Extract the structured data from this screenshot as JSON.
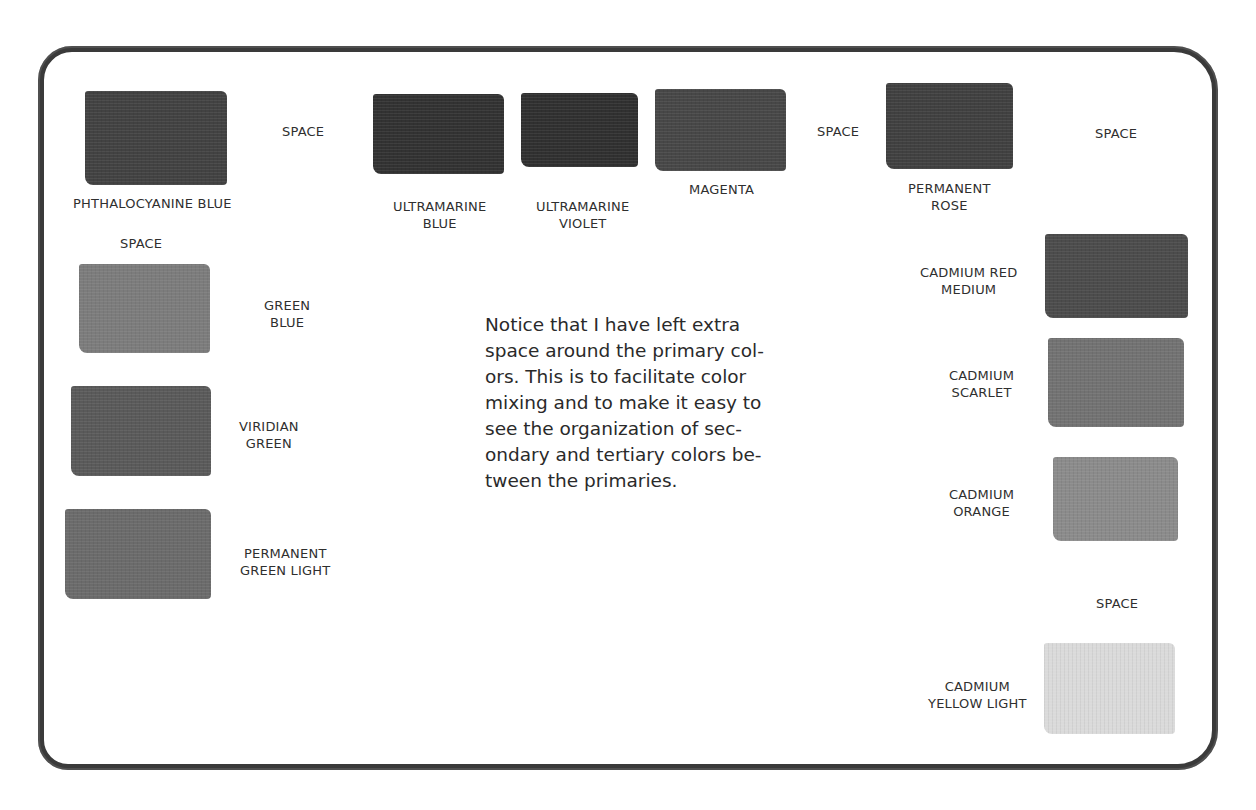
{
  "note": "Notice that I have left extra\nspace around the primary col-\nors. This is to facilitate color\nmixing and to make it easy to\nsee the organization of sec-\nondary and tertiary colors be-\ntween the primaries.",
  "space_label": "SPACE",
  "swatches": [
    {
      "name": "PHTHALOCYANINE BLUE",
      "line1": "PHTHALOCYANINE  BLUE",
      "line2": "",
      "color": "#454545"
    },
    {
      "name": "ULTRAMARINE BLUE",
      "line1": "ULTRAMARINE",
      "line2": "BLUE",
      "color": "#363636"
    },
    {
      "name": "ULTRAMARINE VIOLET",
      "line1": "ULTRAMARINE",
      "line2": "VIOLET",
      "color": "#343434"
    },
    {
      "name": "MAGENTA",
      "line1": "MAGENTA",
      "line2": "",
      "color": "#4a4a4a"
    },
    {
      "name": "PERMANENT ROSE",
      "line1": "PERMANENT",
      "line2": "ROSE",
      "color": "#434343"
    },
    {
      "name": "GREEN BLUE",
      "line1": "GREEN",
      "line2": "BLUE",
      "color": "#7c7c7c"
    },
    {
      "name": "VIRIDIAN GREEN",
      "line1": "VIRIDIAN",
      "line2": "GREEN",
      "color": "#5c5c5c"
    },
    {
      "name": "PERMANENT GREEN LIGHT",
      "line1": "PERMANENT",
      "line2": "GREEN LIGHT",
      "color": "#6c6c6c"
    },
    {
      "name": "CADMIUM RED MEDIUM",
      "line1": "CADMIUM RED",
      "line2": "MEDIUM",
      "color": "#4e4e4e"
    },
    {
      "name": "CADMIUM SCARLET",
      "line1": "CADMIUM",
      "line2": "SCARLET",
      "color": "#737373"
    },
    {
      "name": "CADMIUM ORANGE",
      "line1": "CADMIUM",
      "line2": "ORANGE",
      "color": "#8a8a8a"
    },
    {
      "name": "CADMIUM YELLOW LIGHT",
      "line1": "CADMIUM",
      "line2": "YELLOW LIGHT",
      "color": "#d6d6d6"
    }
  ]
}
